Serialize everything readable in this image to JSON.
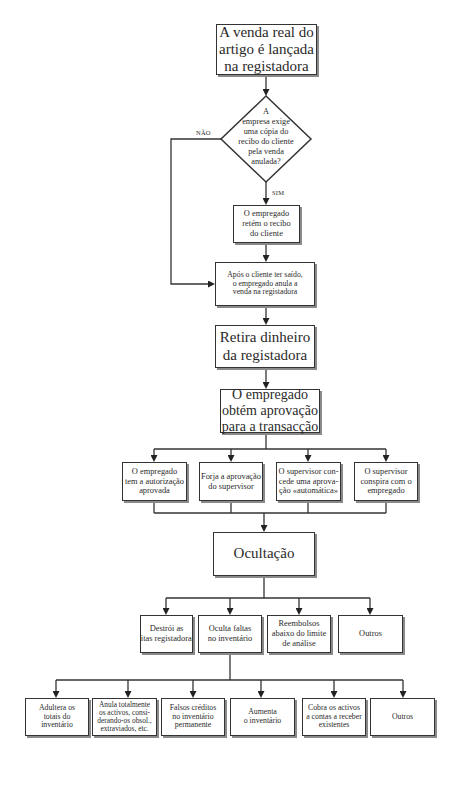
{
  "flowchart": {
    "start": "A venda real do artigo é lançada na registadora",
    "decision": {
      "question": "A empresa exige uma cópia do recibo do cliente pela venda anulada?",
      "no_label": "NÃO",
      "yes_label": "SIM"
    },
    "keeps_receipt": "O empregado retém o recibo do cliente",
    "voids_sale": "Após o cliente ter saído, o empregado anula a venda na registadora",
    "removes_cash": "Retira dinheiro da registadora",
    "gets_approval": "O empregado obtém aprovação para a transacção",
    "approval_methods": [
      "O empregado tem a autorização aprovada",
      "Forja a aprovação do supervisor",
      "O supervisor concede uma aprovação «automática»",
      "O supervisor conspira com o empregado"
    ],
    "concealment": "Ocultação",
    "concealment_methods": [
      "Destrói as fitas registadoras",
      "Oculta faltas no inventário",
      "Reembolsos abaixo do limite de análise",
      "Outros"
    ],
    "inventory_methods": [
      "Adultera os totais do inventário",
      "Anula totalmente os activos, considerando-os obsol., extraviados, etc.",
      "Falsos créditos no inventário permanente",
      "Aumenta o inventário",
      "Cobra os activos a contas a receber existentes",
      "Outros"
    ]
  },
  "display": {
    "start_lines": [
      "A venda real do",
      "artigo é lançada",
      "na registadora"
    ],
    "decision_lines": [
      "A",
      "empresa exige",
      "uma cópia do",
      "recibo do cliente",
      "pela venda",
      "anulada?"
    ],
    "keeps_receipt_lines": [
      "O empregado",
      "retém o recibo",
      "do cliente"
    ],
    "voids_sale_lines": [
      "Após o cliente ter saído,",
      "o empregado anula a",
      "venda na registadora"
    ],
    "removes_cash_lines": [
      "Retira dinheiro",
      "da registadora"
    ],
    "gets_approval_lines": [
      "O empregado",
      "obtém aprovação",
      "para a transacção"
    ],
    "approval_lines": [
      [
        "O empregado",
        "tem a autorização",
        "aprovada"
      ],
      [
        "Forja a aprovação",
        "do supervisor"
      ],
      [
        "O supervisor con-",
        "cede uma aprova-",
        "ção «automática»"
      ],
      [
        "O supervisor",
        "conspira com o",
        "empregado"
      ]
    ],
    "concealment_lines": [
      [
        "Destrói as",
        "fitas registadoras"
      ],
      [
        "Oculta faltas",
        "no inventário"
      ],
      [
        "Reembolsos",
        "abaixo do limite",
        "de análise"
      ],
      [
        "Outros"
      ]
    ],
    "inventory_lines": [
      [
        "Adultera os",
        "totais do",
        "inventário"
      ],
      [
        "Anula totalmente",
        "os activos, consi-",
        "derando-os obsol.,",
        "extraviados, etc."
      ],
      [
        "Falsos créditos",
        "no inventário",
        "permanente"
      ],
      [
        "Aumenta",
        "o inventário"
      ],
      [
        "Cobra os activos",
        "a contas a receber",
        "existentes"
      ],
      [
        "Outros"
      ]
    ]
  },
  "colors": {
    "line": "#333333",
    "shadow": "#8a8a8a",
    "text": "#2a2a2a",
    "background": "#ffffff"
  }
}
